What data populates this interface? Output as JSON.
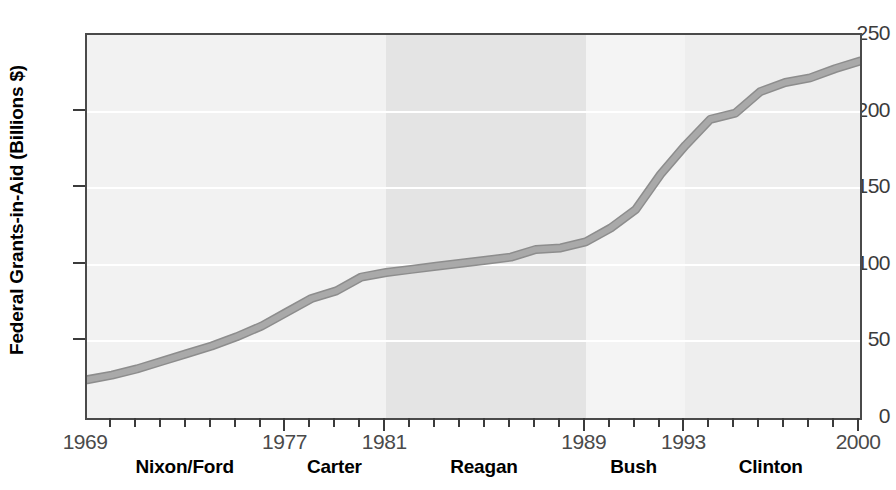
{
  "chart_data": {
    "type": "line",
    "title": "",
    "xlabel": "",
    "ylabel": "Federal Grants-in-Aid (Billions $)",
    "xlim": [
      1969,
      2000
    ],
    "ylim": [
      0,
      250
    ],
    "grid": true,
    "legend": "none",
    "y_ticks": [
      0,
      50,
      100,
      150,
      200,
      250
    ],
    "y_tick_labels": [
      "0",
      "50",
      "100",
      "150",
      "200",
      "250"
    ],
    "x_tick_labels": [
      "1969",
      "1977",
      "1981",
      "1989",
      "1993",
      "2000"
    ],
    "x_tick_values": [
      1969,
      1977,
      1981,
      1989,
      1993,
      2000
    ],
    "x_minor_step": 1,
    "series": [
      {
        "name": "Federal Grants-in-Aid",
        "x": [
          1969,
          1970,
          1971,
          1972,
          1973,
          1974,
          1975,
          1976,
          1977,
          1978,
          1979,
          1980,
          1981,
          1982,
          1983,
          1984,
          1985,
          1986,
          1987,
          1988,
          1989,
          1990,
          1991,
          1992,
          1993,
          1994,
          1995,
          1996,
          1997,
          1998,
          1999,
          2000
        ],
        "y": [
          25,
          28,
          32,
          37,
          42,
          47,
          53,
          60,
          69,
          78,
          83,
          92,
          95,
          97,
          99,
          101,
          103,
          105,
          110,
          111,
          115,
          124,
          136,
          159,
          178,
          195,
          199,
          213,
          219,
          222,
          228,
          233
        ]
      }
    ],
    "eras": [
      {
        "label": "Nixon/Ford",
        "start": 1969,
        "end": 1977,
        "shade": "#f2f2f2"
      },
      {
        "label": "Carter",
        "start": 1977,
        "end": 1981,
        "shade": "#f2f2f2"
      },
      {
        "label": "Reagan",
        "start": 1981,
        "end": 1989,
        "shade": "#e4e4e4"
      },
      {
        "label": "Bush",
        "start": 1989,
        "end": 1993,
        "shade": "#f4f4f4"
      },
      {
        "label": "Clinton",
        "start": 1993,
        "end": 2000,
        "shade": "#eeeeee"
      }
    ],
    "colors": {
      "line": "#a9a9a9",
      "line_edge": "#8d8d8d",
      "plot_background": "#f2f2f2",
      "gridline": "#ffffff",
      "axis": "#4a4a4a",
      "text": "#000000"
    }
  }
}
